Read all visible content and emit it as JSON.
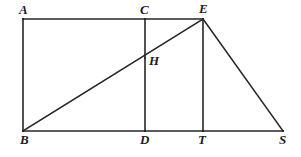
{
  "figure": {
    "type": "geometry-diagram",
    "canvas": {
      "width": 301,
      "height": 157
    },
    "stroke_color": "#262626",
    "background_color": "#ffffff",
    "stroke_width": 1.6,
    "points": [
      {
        "id": "A",
        "label": "A",
        "x": 23,
        "y": 19,
        "label_x": 19,
        "label_y": 3,
        "label_anchor": "above-left"
      },
      {
        "id": "C",
        "label": "C",
        "x": 145,
        "y": 19,
        "label_x": 140,
        "label_y": 3,
        "label_anchor": "above"
      },
      {
        "id": "E",
        "label": "E",
        "x": 203,
        "y": 19,
        "label_x": 199,
        "label_y": 2,
        "label_anchor": "above"
      },
      {
        "id": "H",
        "label": "H",
        "x": 145,
        "y": 58,
        "label_x": 149,
        "label_y": 54,
        "label_anchor": "right"
      },
      {
        "id": "B",
        "label": "B",
        "x": 23,
        "y": 131,
        "label_x": 20,
        "label_y": 133,
        "label_anchor": "below-left"
      },
      {
        "id": "D",
        "label": "D",
        "x": 145,
        "y": 131,
        "label_x": 140,
        "label_y": 133,
        "label_anchor": "below"
      },
      {
        "id": "T",
        "label": "T",
        "x": 203,
        "y": 131,
        "label_x": 198,
        "label_y": 133,
        "label_anchor": "below"
      },
      {
        "id": "S",
        "label": "S",
        "x": 283,
        "y": 131,
        "label_x": 279,
        "label_y": 133,
        "label_anchor": "below-right"
      }
    ],
    "segments": [
      {
        "id": "AE",
        "name": "top-edge-a-to-e",
        "x1": 23,
        "y1": 19,
        "x2": 203,
        "y2": 19
      },
      {
        "id": "BS",
        "name": "base-edge-b-to-s",
        "x1": 23,
        "y1": 131,
        "x2": 283,
        "y2": 131
      },
      {
        "id": "AB",
        "name": "left-edge-a-to-b",
        "x1": 23,
        "y1": 19,
        "x2": 23,
        "y2": 131
      },
      {
        "id": "CD",
        "name": "vertical-c-to-d",
        "x1": 145,
        "y1": 19,
        "x2": 145,
        "y2": 131
      },
      {
        "id": "ET",
        "name": "vertical-e-to-t",
        "x1": 203,
        "y1": 19,
        "x2": 203,
        "y2": 131
      },
      {
        "id": "BE",
        "name": "diagonal-b-to-e",
        "x1": 23,
        "y1": 131,
        "x2": 203,
        "y2": 19
      },
      {
        "id": "ES",
        "name": "hypotenuse-e-to-s",
        "x1": 203,
        "y1": 19,
        "x2": 283,
        "y2": 131
      }
    ]
  }
}
